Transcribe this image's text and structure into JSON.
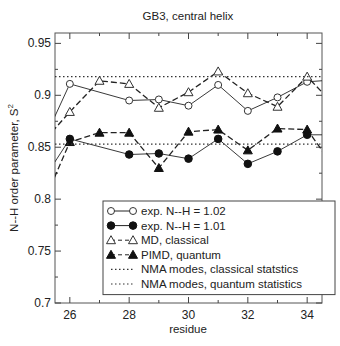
{
  "chart_data": {
    "type": "line",
    "title": "GB3, central helix",
    "xlabel": "residue",
    "ylabel": "N--H order parameter, S",
    "ylabel_superscript": "2",
    "xlim": [
      25.5,
      34.5
    ],
    "ylim": [
      0.7,
      0.96
    ],
    "xticks": [
      26,
      28,
      30,
      32,
      34
    ],
    "xminor": [
      27,
      29,
      31,
      33
    ],
    "yticks": [
      0.7,
      0.75,
      0.8,
      0.85,
      0.9,
      0.95
    ],
    "ytick_labels": [
      "0.7",
      "0.75",
      "0.8",
      "0.85",
      "0.9",
      "0.95"
    ],
    "xtick_labels": [
      "26",
      "28",
      "30",
      "32",
      "34"
    ],
    "grid": false,
    "legend_position": "lower-center",
    "x": [
      25,
      26,
      27,
      28,
      29,
      30,
      31,
      32,
      33,
      34,
      35
    ],
    "series": [
      {
        "name": "exp. N--H = 1.02",
        "marker": "open-circle",
        "line": "solid",
        "values": [
          0.849,
          0.911,
          null,
          0.895,
          0.896,
          0.89,
          0.91,
          0.885,
          0.898,
          0.913,
          0.915
        ]
      },
      {
        "name": "exp. N--H = 1.01",
        "marker": "filled-circle",
        "line": "solid",
        "values": [
          0.814,
          0.858,
          null,
          0.843,
          0.844,
          0.839,
          0.858,
          0.834,
          0.846,
          0.862,
          0.862
        ]
      },
      {
        "name": "MD, classical",
        "marker": "open-triangle",
        "line": "dashed",
        "values": [
          0.852,
          0.884,
          0.914,
          0.911,
          0.888,
          0.903,
          0.923,
          0.902,
          0.889,
          0.918,
          0.888
        ]
      },
      {
        "name": "PIMD, quantum",
        "marker": "filled-triangle",
        "line": "dashed",
        "values": [
          0.789,
          0.855,
          0.864,
          0.864,
          0.83,
          0.865,
          0.867,
          0.847,
          0.868,
          0.867,
          0.827
        ]
      },
      {
        "name": "NMA modes, classical statstics",
        "marker": "none",
        "line": "dotted",
        "hline": 0.918
      },
      {
        "name": "NMA modes, quantum statistics",
        "marker": "none",
        "line": "dotted",
        "hline": 0.853
      }
    ]
  }
}
